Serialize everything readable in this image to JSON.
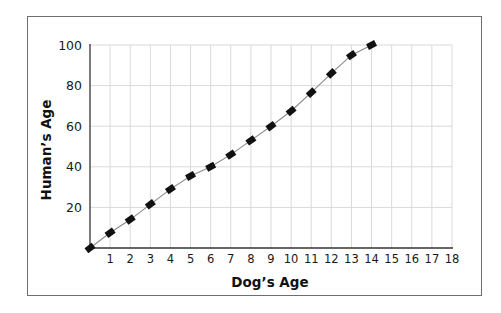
{
  "chart_data": {
    "type": "line",
    "title": "",
    "xlabel": "Dog’s Age",
    "ylabel": "Human’s Age",
    "x": [
      0,
      1,
      2,
      3,
      4,
      5,
      6,
      7,
      8,
      9,
      10,
      11,
      12,
      13,
      14
    ],
    "series": [
      {
        "name": "Human's Age",
        "values": [
          0,
          7.5,
          14,
          21.5,
          29,
          35.5,
          40,
          46,
          53,
          60,
          67.5,
          76.5,
          86,
          95,
          100
        ]
      }
    ],
    "xlim": [
      0,
      18
    ],
    "ylim": [
      0,
      100
    ],
    "xticks": [
      1,
      2,
      3,
      4,
      5,
      6,
      7,
      8,
      9,
      10,
      11,
      12,
      13,
      14,
      15,
      16,
      17,
      18
    ],
    "yticks": [
      20,
      40,
      60,
      80,
      100
    ],
    "grid": true,
    "legend": "none",
    "marker": "square",
    "colors": {
      "line": "#8a8a8a",
      "marker": "#111111",
      "grid": "#d9d9d9",
      "axis": "#333333"
    }
  }
}
